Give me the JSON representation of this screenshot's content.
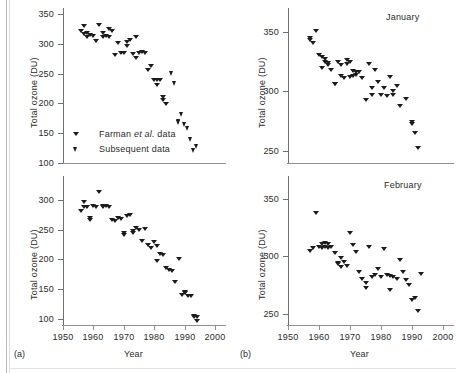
{
  "figure": {
    "panels": [
      {
        "tag": "(a)",
        "month_label": "",
        "xlabel": "Year",
        "ylabel": "Total ozone (DU)"
      },
      {
        "tag": "(b)",
        "month_label": "January",
        "xlabel": "Year",
        "ylabel": "Total ozone (DU)"
      }
    ],
    "legend": [
      {
        "label_html": "Farman <i>et al.</i> data",
        "marker": "triangle-down",
        "series": "farman"
      },
      {
        "label_html": "Subsequent data",
        "marker": "triangle-down-bold",
        "series": "subsequent"
      }
    ],
    "month_labels": {
      "top_right": "January",
      "bottom_right": "February"
    },
    "tags": {
      "left": "(a)",
      "right": "(b)"
    }
  },
  "chart_data": [
    {
      "id": "panel-a-top",
      "type": "scatter",
      "title": "",
      "xlabel": "Year",
      "ylabel": "Total ozone (DU)",
      "xlim": [
        1950,
        2000
      ],
      "ylim": [
        100,
        350
      ],
      "xticks": [
        1950,
        1960,
        1970,
        1980,
        1990,
        2000
      ],
      "xticklabels": [
        "1950",
        "1960",
        "1970",
        "1980",
        "1990",
        "2000"
      ],
      "yticks": [
        100,
        150,
        200,
        250,
        300,
        350
      ],
      "yticklabels": [
        "100",
        "150",
        "200",
        "250",
        "300",
        "350"
      ],
      "grid": false,
      "legend": [
        "Farman et al. data",
        "Subsequent data"
      ],
      "legend_position": "lower-left",
      "series": [
        {
          "name": "Farman et al. data",
          "marker": "triangle-down",
          "points": [
            [
              1956,
              322
            ],
            [
              1957,
              330
            ],
            [
              1957,
              316
            ],
            [
              1958,
              318
            ],
            [
              1958,
              312
            ],
            [
              1959,
              314
            ],
            [
              1960,
              313
            ],
            [
              1961,
              304
            ],
            [
              1962,
              332
            ],
            [
              1963,
              318
            ],
            [
              1963,
              311
            ],
            [
              1964,
              313
            ],
            [
              1965,
              325
            ],
            [
              1965,
              311
            ],
            [
              1966,
              322
            ],
            [
              1967,
              281
            ],
            [
              1968,
              301
            ],
            [
              1969,
              285
            ],
            [
              1970,
              284
            ],
            [
              1971,
              303
            ],
            [
              1971,
              297
            ],
            [
              1972,
              307
            ],
            [
              1973,
              283
            ],
            [
              1974,
              311
            ],
            [
              1974,
              276
            ],
            [
              1975,
              285
            ],
            [
              1976,
              286
            ],
            [
              1977,
              285
            ],
            [
              1978,
              256
            ],
            [
              1979,
              262
            ],
            [
              1980,
              240
            ],
            [
              1981,
              231
            ],
            [
              1981,
              239
            ],
            [
              1982,
              239
            ],
            [
              1983,
              211
            ],
            [
              1983,
              205
            ],
            [
              1984,
              199
            ]
          ]
        },
        {
          "name": "Subsequent data",
          "marker": "triangle-down-bold",
          "points": [
            [
              1986,
              251
            ],
            [
              1987,
              235
            ],
            [
              1988,
              171
            ],
            [
              1988,
              168
            ],
            [
              1989,
              182
            ],
            [
              1990,
              166
            ],
            [
              1991,
              158
            ],
            [
              1992,
              140
            ],
            [
              1993,
              122
            ],
            [
              1994,
              129
            ]
          ]
        }
      ]
    },
    {
      "id": "panel-a-bottom",
      "type": "scatter",
      "title": "",
      "xlabel": "Year",
      "ylabel": "Total ozone (DU)",
      "xlim": [
        1950,
        2000
      ],
      "ylim": [
        90,
        330
      ],
      "xticks": [
        1950,
        1960,
        1970,
        1980,
        1990,
        2000
      ],
      "xticklabels": [
        "1950",
        "1960",
        "1970",
        "1980",
        "1990",
        "2000"
      ],
      "yticks": [
        100,
        150,
        200,
        250,
        300
      ],
      "yticklabels": [
        "100",
        "150",
        "200",
        "250",
        "300"
      ],
      "grid": false,
      "series": [
        {
          "name": "October total ozone",
          "marker": "triangle-down",
          "points": [
            [
              1956,
              282
            ],
            [
              1957,
              297
            ],
            [
              1957,
              288
            ],
            [
              1958,
              288
            ],
            [
              1959,
              270
            ],
            [
              1959,
              266
            ],
            [
              1960,
              290
            ],
            [
              1961,
              288
            ],
            [
              1962,
              313
            ],
            [
              1963,
              290
            ],
            [
              1963,
              288
            ],
            [
              1964,
              290
            ],
            [
              1965,
              288
            ],
            [
              1966,
              266
            ],
            [
              1967,
              264
            ],
            [
              1968,
              270
            ],
            [
              1969,
              268
            ],
            [
              1970,
              244
            ],
            [
              1970,
              241
            ],
            [
              1971,
              273
            ],
            [
              1972,
              274
            ],
            [
              1973,
              247
            ],
            [
              1973,
              244
            ],
            [
              1974,
              252
            ],
            [
              1975,
              249
            ],
            [
              1976,
              231
            ],
            [
              1977,
              251
            ],
            [
              1978,
              224
            ],
            [
              1979,
              219
            ],
            [
              1980,
              229
            ],
            [
              1981,
              223
            ],
            [
              1981,
              198
            ],
            [
              1982,
              209
            ],
            [
              1983,
              207
            ],
            [
              1984,
              185
            ],
            [
              1985,
              183
            ],
            [
              1986,
              181
            ],
            [
              1987,
              163
            ],
            [
              1988,
              201
            ],
            [
              1989,
              141
            ],
            [
              1990,
              146
            ],
            [
              1990,
              144
            ],
            [
              1991,
              139
            ],
            [
              1992,
              138
            ],
            [
              1993,
              105
            ],
            [
              1993,
              103
            ],
            [
              1994,
              104
            ],
            [
              1994,
              96
            ]
          ]
        }
      ]
    },
    {
      "id": "panel-b-january",
      "type": "scatter",
      "title": "January",
      "xlabel": "Year",
      "ylabel": "Total ozone (DU)",
      "xlim": [
        1950,
        2000
      ],
      "ylim": [
        240,
        365
      ],
      "xticks": [
        1950,
        1960,
        1970,
        1980,
        1990,
        2000
      ],
      "xticklabels": [
        "1950",
        "1960",
        "1970",
        "1980",
        "1990",
        "2000"
      ],
      "yticks": [
        250,
        300,
        350
      ],
      "yticklabels": [
        "250",
        "300",
        "350"
      ],
      "grid": false,
      "series": [
        {
          "name": "January total ozone",
          "marker": "triangle-down",
          "points": [
            [
              1957,
              345
            ],
            [
              1957,
              343
            ],
            [
              1958,
              341
            ],
            [
              1959,
              351
            ],
            [
              1960,
              331
            ],
            [
              1961,
              329
            ],
            [
              1961,
              320
            ],
            [
              1962,
              327
            ],
            [
              1962,
              325
            ],
            [
              1963,
              324
            ],
            [
              1963,
              322
            ],
            [
              1964,
              318
            ],
            [
              1965,
              306
            ],
            [
              1965,
              306
            ],
            [
              1966,
              325
            ],
            [
              1967,
              322
            ],
            [
              1967,
              313
            ],
            [
              1968,
              311
            ],
            [
              1969,
              326
            ],
            [
              1969,
              323
            ],
            [
              1970,
              325
            ],
            [
              1970,
              312
            ],
            [
              1971,
              317
            ],
            [
              1971,
              313
            ],
            [
              1972,
              316
            ],
            [
              1972,
              314
            ],
            [
              1973,
              316
            ],
            [
              1974,
              311
            ],
            [
              1975,
              293
            ],
            [
              1976,
              323
            ],
            [
              1977,
              303
            ],
            [
              1977,
              297
            ],
            [
              1978,
              318
            ],
            [
              1979,
              308
            ],
            [
              1980,
              297
            ],
            [
              1981,
              303
            ],
            [
              1982,
              296
            ],
            [
              1983,
              312
            ],
            [
              1984,
              300
            ],
            [
              1984,
              297
            ],
            [
              1985,
              305
            ],
            [
              1986,
              288
            ],
            [
              1988,
              294
            ],
            [
              1990,
              274
            ],
            [
              1990,
              273
            ],
            [
              1991,
              265
            ],
            [
              1992,
              253
            ]
          ]
        }
      ]
    },
    {
      "id": "panel-b-february",
      "type": "scatter",
      "title": "February",
      "xlabel": "Year",
      "ylabel": "Total ozone (DU)",
      "xlim": [
        1950,
        2000
      ],
      "ylim": [
        240,
        365
      ],
      "xticks": [
        1950,
        1960,
        1970,
        1980,
        1990,
        2000
      ],
      "xticklabels": [
        "1950",
        "1960",
        "1970",
        "1980",
        "1990",
        "2000"
      ],
      "yticks": [
        250,
        300,
        350
      ],
      "yticklabels": [
        "250",
        "300",
        "350"
      ],
      "grid": false,
      "series": [
        {
          "name": "February total ozone",
          "marker": "triangle-down",
          "points": [
            [
              1957,
              305
            ],
            [
              1958,
              307
            ],
            [
              1959,
              338
            ],
            [
              1960,
              308
            ],
            [
              1961,
              311
            ],
            [
              1961,
              307
            ],
            [
              1962,
              312
            ],
            [
              1962,
              308
            ],
            [
              1963,
              311
            ],
            [
              1963,
              307
            ],
            [
              1964,
              308
            ],
            [
              1965,
              303
            ],
            [
              1966,
              294
            ],
            [
              1966,
              293
            ],
            [
              1967,
              299
            ],
            [
              1967,
              291
            ],
            [
              1968,
              295
            ],
            [
              1969,
              292
            ],
            [
              1970,
              320
            ],
            [
              1971,
              310
            ],
            [
              1972,
              304
            ],
            [
              1973,
              286
            ],
            [
              1974,
              280
            ],
            [
              1975,
              277
            ],
            [
              1975,
              272
            ],
            [
              1976,
              308
            ],
            [
              1977,
              282
            ],
            [
              1978,
              284
            ],
            [
              1979,
              289
            ],
            [
              1980,
              282
            ],
            [
              1981,
              306
            ],
            [
              1982,
              284
            ],
            [
              1983,
              283
            ],
            [
              1983,
              271
            ],
            [
              1984,
              282
            ],
            [
              1985,
              280
            ],
            [
              1986,
              297
            ],
            [
              1987,
              286
            ],
            [
              1988,
              279
            ],
            [
              1989,
              275
            ],
            [
              1990,
              262
            ],
            [
              1991,
              264
            ],
            [
              1992,
              252
            ],
            [
              1993,
              285
            ]
          ]
        }
      ]
    }
  ]
}
